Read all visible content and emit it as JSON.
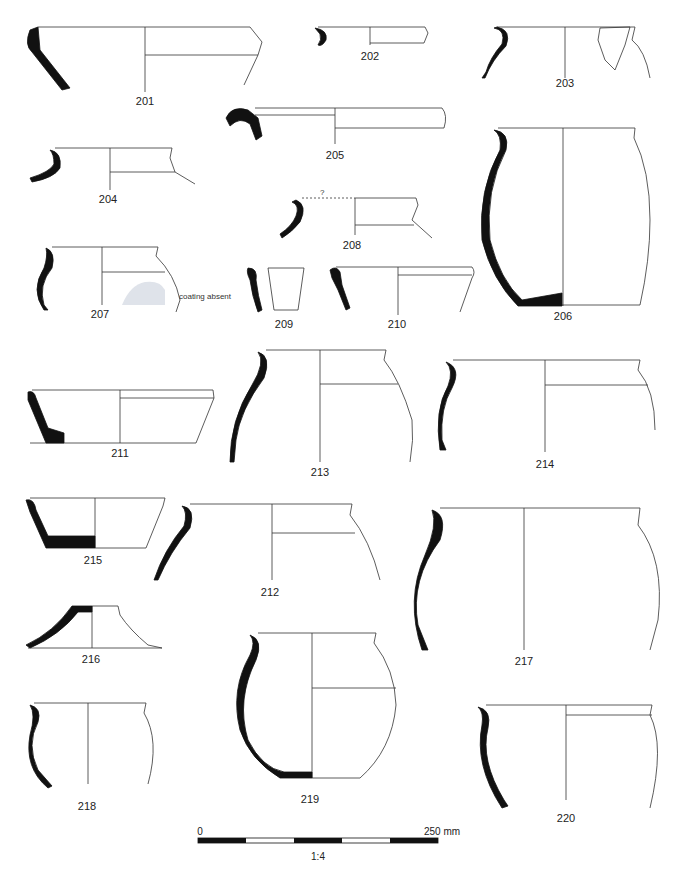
{
  "figure": {
    "vessels": [
      {
        "id": "201",
        "label": "201",
        "x": 145,
        "y": 127
      },
      {
        "id": "202",
        "label": "202",
        "x": 370,
        "y": 53
      },
      {
        "id": "203",
        "label": "203",
        "x": 565,
        "y": 77
      },
      {
        "id": "204",
        "label": "204",
        "x": 108,
        "y": 193
      },
      {
        "id": "205",
        "label": "205",
        "x": 335,
        "y": 149
      },
      {
        "id": "206",
        "label": "206",
        "x": 563,
        "y": 310
      },
      {
        "id": "207",
        "label": "207",
        "x": 100,
        "y": 308
      },
      {
        "id": "208",
        "label": "208",
        "x": 352,
        "y": 239
      },
      {
        "id": "209",
        "label": "209",
        "x": 284,
        "y": 318
      },
      {
        "id": "210",
        "label": "210",
        "x": 397,
        "y": 318
      },
      {
        "id": "211",
        "label": "211",
        "x": 120,
        "y": 447
      },
      {
        "id": "212",
        "label": "212",
        "x": 270,
        "y": 586
      },
      {
        "id": "213",
        "label": "213",
        "x": 320,
        "y": 466
      },
      {
        "id": "214",
        "label": "214",
        "x": 545,
        "y": 458
      },
      {
        "id": "215",
        "label": "215",
        "x": 93,
        "y": 554
      },
      {
        "id": "216",
        "label": "216",
        "x": 91,
        "y": 653
      },
      {
        "id": "217",
        "label": "217",
        "x": 524,
        "y": 655
      },
      {
        "id": "218",
        "label": "218",
        "x": 87,
        "y": 800
      },
      {
        "id": "219",
        "label": "219",
        "x": 310,
        "y": 793
      },
      {
        "id": "220",
        "label": "220",
        "x": 566,
        "y": 812
      }
    ],
    "annotations": {
      "coating_absent": "coating absent",
      "uncertain_diameter": "?"
    },
    "scale_bar": {
      "start_label": "0",
      "end_label": "250 mm",
      "ratio_label": "1:4",
      "segments": 5
    },
    "colors": {
      "section_fill": "#111111",
      "line": "#333333",
      "coating_absent_fill": "#dfe3ea"
    }
  }
}
